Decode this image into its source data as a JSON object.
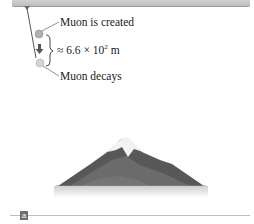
{
  "diagram": {
    "labels": {
      "created": "Muon is created",
      "distance_prefix": "≈ 6.6 × 10",
      "distance_exp": "2",
      "distance_unit": " m",
      "decays": "Muon decays"
    },
    "panel_badge": "a",
    "colors": {
      "top_bar": "#c8c8c8",
      "particle": "#b9b9b9",
      "mountain_dark": "#4f4f4f",
      "snow": "#f4f4f4",
      "badge": "#6e6e6e"
    },
    "icons": {
      "muon_particle": "gray-sphere",
      "direction": "down-arrow",
      "span": "curly-brace",
      "mountain": "snow-capped-mountain"
    }
  }
}
